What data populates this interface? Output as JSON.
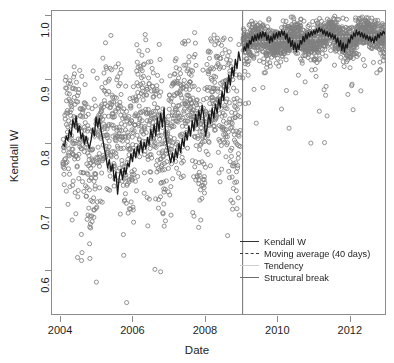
{
  "chart_data": {
    "type": "scatter",
    "title": "",
    "xlabel": "Date",
    "ylabel": "Kendall W",
    "xlim": [
      2003.75,
      2013.0
    ],
    "ylim": [
      0.53,
      1.008
    ],
    "grid": false,
    "xticks": [
      "2004",
      "2006",
      "2008",
      "2010",
      "2012"
    ],
    "xtick_values": [
      2004,
      2006,
      2008,
      2010,
      2012
    ],
    "yticks": [
      "0.6",
      "0.7",
      "0.8",
      "0.9",
      "1.0"
    ],
    "ytick_values": [
      0.6,
      0.7,
      0.8,
      0.9,
      1.0
    ],
    "legend_position": "center-right",
    "annotations": [
      {
        "type": "vline",
        "name": "structural-break",
        "x": 2009.0,
        "label": "Structural break"
      }
    ],
    "series": [
      {
        "name": "Kendall W",
        "type": "scatter",
        "marker": "open-circle",
        "color": "#808080",
        "description": "Daily Kendall W concordance values, 2004-2013. Pre-break (2004 to 2009) values scatter widely around 0.80 with spread from 0.54 to 0.97; post-break (2009 to 2013) values cluster tightly near 0.97 with spread from 0.77 to 1.00."
      },
      {
        "name": "Moving average (40 days)",
        "type": "line",
        "style": "solid",
        "color": "#1a1a1a",
        "description": "40-day moving average; oscillates between 0.72 and 0.86 before the break, jumps to roughly 0.94-0.98 after the break."
      },
      {
        "name": "Tendency",
        "type": "line",
        "style": "dotted",
        "color": "#b8b8b8",
        "description": "Slowly rising tendency line from about 0.80 in 2004 to about 0.97 in 2013."
      },
      {
        "name": "Structural break",
        "type": "vline",
        "style": "solid",
        "color": "#707070",
        "x": 2009.0
      }
    ],
    "segments": {
      "pre_break": {
        "x_start": 2004.05,
        "x_end": 2008.95,
        "mean": 0.805,
        "sd": 0.072,
        "min": 0.54,
        "max": 0.97,
        "trend_start": 0.795,
        "trend_end": 0.865
      },
      "post_break": {
        "x_start": 2009.02,
        "x_end": 2012.97,
        "mean": 0.966,
        "sd": 0.018,
        "min": 0.77,
        "max": 1.0,
        "trend_start": 0.958,
        "trend_end": 0.972
      }
    },
    "moving_average_pre": [
      0.8,
      0.796,
      0.812,
      0.805,
      0.822,
      0.812,
      0.838,
      0.826,
      0.843,
      0.818,
      0.828,
      0.808,
      0.816,
      0.799,
      0.812,
      0.801,
      0.793,
      0.806,
      0.824,
      0.812,
      0.842,
      0.826,
      0.84,
      0.821,
      0.808,
      0.792,
      0.779,
      0.762,
      0.775,
      0.757,
      0.768,
      0.742,
      0.756,
      0.721,
      0.748,
      0.76,
      0.744,
      0.762,
      0.752,
      0.77,
      0.764,
      0.784,
      0.772,
      0.792,
      0.778,
      0.796,
      0.784,
      0.804,
      0.786,
      0.802,
      0.792,
      0.81,
      0.798,
      0.822,
      0.808,
      0.83,
      0.812,
      0.84,
      0.82,
      0.848,
      0.826,
      0.856,
      0.812,
      0.796,
      0.782,
      0.77,
      0.786,
      0.772,
      0.792,
      0.778,
      0.8,
      0.786,
      0.808,
      0.796,
      0.818,
      0.806,
      0.828,
      0.812,
      0.836,
      0.82,
      0.846,
      0.828,
      0.852,
      0.838,
      0.86,
      0.842,
      0.812,
      0.826,
      0.846,
      0.832,
      0.856,
      0.84,
      0.862,
      0.848,
      0.87,
      0.856,
      0.882,
      0.868,
      0.896,
      0.88,
      0.908,
      0.892,
      0.92,
      0.906,
      0.932,
      0.918,
      0.944,
      0.93
    ],
    "moving_average_post": [
      0.944,
      0.952,
      0.946,
      0.958,
      0.95,
      0.962,
      0.956,
      0.968,
      0.96,
      0.97,
      0.962,
      0.972,
      0.964,
      0.974,
      0.966,
      0.976,
      0.968,
      0.974,
      0.962,
      0.97,
      0.958,
      0.968,
      0.96,
      0.972,
      0.964,
      0.974,
      0.966,
      0.976,
      0.968,
      0.978,
      0.97,
      0.976,
      0.964,
      0.972,
      0.958,
      0.966,
      0.952,
      0.962,
      0.948,
      0.958,
      0.944,
      0.956,
      0.948,
      0.962,
      0.956,
      0.968,
      0.96,
      0.972,
      0.964,
      0.974,
      0.968,
      0.976,
      0.97,
      0.978,
      0.972,
      0.98,
      0.974,
      0.982,
      0.976,
      0.98,
      0.972,
      0.978,
      0.97,
      0.976,
      0.968,
      0.974,
      0.966,
      0.972,
      0.964,
      0.97,
      0.958,
      0.966,
      0.952,
      0.962,
      0.946,
      0.958,
      0.944,
      0.956,
      0.95,
      0.964,
      0.958,
      0.97,
      0.964,
      0.974,
      0.968,
      0.978,
      0.97,
      0.976,
      0.968,
      0.974,
      0.966,
      0.972,
      0.964,
      0.97,
      0.962,
      0.968,
      0.96,
      0.966,
      0.958,
      0.968,
      0.962,
      0.972,
      0.966,
      0.974,
      0.97,
      0.976,
      0.972,
      0.978
    ]
  },
  "axes": {
    "x_title": "Date",
    "y_title": "Kendall W",
    "x_ticks": [
      {
        "label": "2004",
        "value": 2004
      },
      {
        "label": "2006",
        "value": 2006
      },
      {
        "label": "2008",
        "value": 2008
      },
      {
        "label": "2010",
        "value": 2010
      },
      {
        "label": "2012",
        "value": 2012
      }
    ],
    "y_ticks": [
      {
        "label": "1.0",
        "value": 1.0
      },
      {
        "label": "0.9",
        "value": 0.9
      },
      {
        "label": "0.8",
        "value": 0.8
      },
      {
        "label": "0.7",
        "value": 0.7
      },
      {
        "label": "0.6",
        "value": 0.6
      }
    ]
  },
  "legend": {
    "items": [
      {
        "label": "Kendall W",
        "style": "solid-thick",
        "color": "#333333"
      },
      {
        "label": "Moving average (40 days)",
        "style": "dashed",
        "color": "#3a3a3a"
      },
      {
        "label": "Tendency",
        "style": "dotted",
        "color": "#cfcfcf"
      },
      {
        "label": "Structural break",
        "style": "solid-thin",
        "color": "#6e6e6e"
      }
    ]
  },
  "colors": {
    "marker_stroke": "#808080",
    "moving_average": "#1a1a1a",
    "tendency": "#c0c0c0",
    "structural_break": "#707070",
    "frame": "#8c8c8c",
    "text": "#1e1e1e",
    "background": "#ffffff"
  }
}
